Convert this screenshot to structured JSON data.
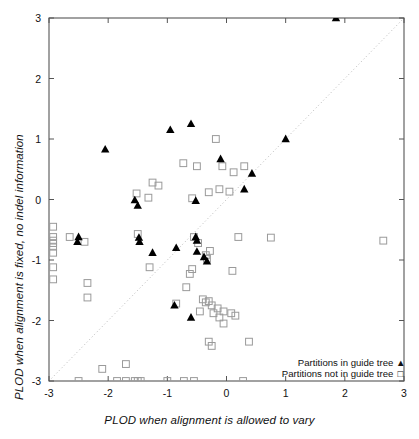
{
  "chart_data": {
    "type": "scatter",
    "title": "",
    "xlabel": "PLOD when alignment is allowed to vary",
    "ylabel": "PLOD when alignment is fixed, no indel information",
    "xlim": [
      -3,
      3
    ],
    "ylim": [
      -3,
      3
    ],
    "xticks": [
      -3,
      -2,
      -1,
      0,
      1,
      2,
      3
    ],
    "yticks": [
      -3,
      -2,
      -1,
      0,
      1,
      2,
      3
    ],
    "xticklabels": [
      "-3",
      "-2",
      "-1",
      "0",
      "1",
      "2",
      "3"
    ],
    "yticklabels": [
      "-3",
      "-2",
      "-1",
      "0",
      "1",
      "2",
      "3"
    ],
    "grid": false,
    "legend_position": "bottom-right",
    "reference_line": {
      "type": "diagonal-dotted",
      "from": [
        -3,
        -3
      ],
      "to": [
        3,
        3
      ],
      "style": "dotted",
      "color": "#b3b3b3"
    },
    "colors": {
      "filled": "#000000",
      "open": "#9a9a9a",
      "axis": "#555555",
      "refline": "#b8b8b8"
    },
    "series": [
      {
        "name": "Partitions in guide tree",
        "marker": "filled-triangle",
        "points": [
          [
            1.85,
            3.0
          ],
          [
            -0.6,
            1.25
          ],
          [
            -0.95,
            1.15
          ],
          [
            1.0,
            1.0
          ],
          [
            -2.05,
            0.83
          ],
          [
            -0.1,
            0.67
          ],
          [
            0.43,
            0.43
          ],
          [
            -1.55,
            -0.01
          ],
          [
            -0.52,
            -0.02
          ],
          [
            0.3,
            0.17
          ],
          [
            -1.5,
            -0.1
          ],
          [
            -2.5,
            -0.62
          ],
          [
            -2.52,
            -0.7
          ],
          [
            -1.48,
            -0.63
          ],
          [
            -1.47,
            -0.7
          ],
          [
            -0.52,
            -0.62
          ],
          [
            -0.5,
            -0.68
          ],
          [
            -0.85,
            -0.8
          ],
          [
            -0.5,
            -0.86
          ],
          [
            -0.38,
            -0.95
          ],
          [
            -1.25,
            -0.88
          ],
          [
            -0.33,
            -1.02
          ],
          [
            -0.88,
            -1.75
          ],
          [
            -0.6,
            -1.95
          ]
        ]
      },
      {
        "name": "Partitions not in guide tree",
        "marker": "open-square",
        "points": [
          [
            -0.18,
            1.0
          ],
          [
            -0.73,
            0.6
          ],
          [
            -0.07,
            0.55
          ],
          [
            0.3,
            0.55
          ],
          [
            -0.5,
            0.55
          ],
          [
            0.12,
            0.45
          ],
          [
            -1.25,
            0.28
          ],
          [
            -1.15,
            0.23
          ],
          [
            -0.12,
            0.17
          ],
          [
            0.05,
            0.13
          ],
          [
            -0.3,
            0.12
          ],
          [
            -1.52,
            0.1
          ],
          [
            -1.32,
            0.03
          ],
          [
            -0.58,
            0.02
          ],
          [
            -2.93,
            -0.45
          ],
          [
            -2.93,
            -0.62
          ],
          [
            -2.93,
            -0.68
          ],
          [
            -2.93,
            -0.72
          ],
          [
            -2.93,
            -0.78
          ],
          [
            -2.93,
            -0.88
          ],
          [
            -2.93,
            -1.12
          ],
          [
            -2.93,
            -1.32
          ],
          [
            -2.65,
            -0.62
          ],
          [
            -2.4,
            -0.7
          ],
          [
            -1.5,
            -0.57
          ],
          [
            -0.55,
            -0.62
          ],
          [
            0.2,
            -0.62
          ],
          [
            0.75,
            -0.63
          ],
          [
            2.65,
            -0.68
          ],
          [
            -0.48,
            -0.72
          ],
          [
            -0.28,
            -0.85
          ],
          [
            -0.35,
            -0.92
          ],
          [
            -0.33,
            -0.98
          ],
          [
            -1.3,
            -1.12
          ],
          [
            -0.58,
            -1.15
          ],
          [
            -0.62,
            -1.23
          ],
          [
            0.1,
            -1.18
          ],
          [
            -2.35,
            -1.38
          ],
          [
            -2.35,
            -1.62
          ],
          [
            -0.68,
            -1.45
          ],
          [
            -0.85,
            -1.72
          ],
          [
            -0.4,
            -1.65
          ],
          [
            -0.35,
            -1.7
          ],
          [
            -0.3,
            -1.68
          ],
          [
            -0.25,
            -1.75
          ],
          [
            -0.15,
            -1.8
          ],
          [
            -0.45,
            -1.85
          ],
          [
            -0.22,
            -1.88
          ],
          [
            -0.05,
            -1.85
          ],
          [
            0.08,
            -1.88
          ],
          [
            0.15,
            -1.92
          ],
          [
            -0.12,
            -1.95
          ],
          [
            -0.05,
            -2.05
          ],
          [
            -0.3,
            -2.35
          ],
          [
            -0.25,
            -2.42
          ],
          [
            0.38,
            -2.35
          ],
          [
            -1.7,
            -2.72
          ],
          [
            -2.1,
            -2.8
          ],
          [
            -2.5,
            -3.0
          ],
          [
            -1.85,
            -3.0
          ],
          [
            -1.7,
            -3.0
          ],
          [
            -1.55,
            -3.0
          ],
          [
            -1.5,
            -3.0
          ],
          [
            -1.45,
            -3.0
          ],
          [
            -1.0,
            -3.0
          ],
          [
            -0.72,
            -3.0
          ],
          [
            -0.55,
            -3.0
          ],
          [
            0.28,
            -3.0
          ]
        ]
      }
    ]
  },
  "legend": {
    "entries": [
      {
        "label": "Partitions in guide tree",
        "glyph": "▲"
      },
      {
        "label": "Partitions not in guide tree",
        "glyph": "□"
      }
    ]
  }
}
